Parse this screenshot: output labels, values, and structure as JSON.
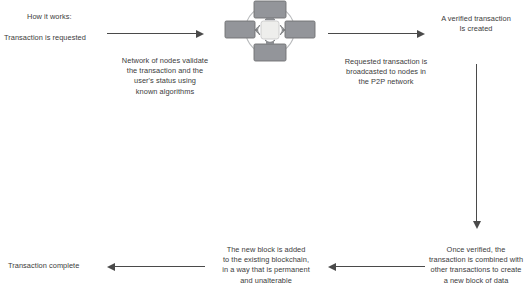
{
  "diagram": {
    "title": "How it works:",
    "theme": {
      "text_color": "#3b3b3b",
      "arrow_color": "#4a4a4a",
      "node_fill": "#8f9194",
      "node_stroke": "#6f7173",
      "center_fill": "#e8e8e6",
      "ring_stroke": "#b9bbbd",
      "background": "#ffffff"
    },
    "steps": [
      {
        "id": "transaction-requested",
        "label": "Transaction is requested",
        "align": "left"
      },
      {
        "id": "nodes-validate",
        "label": "Network of nodes validate\nthe transaction and the\nuser's status using\nknown algorithms",
        "align": "center"
      },
      {
        "id": "broadcast-p2p",
        "label": "Requested transaction is\nbroadcasted to nodes in\nthe P2P network",
        "align": "center"
      },
      {
        "id": "verified-transaction",
        "label": "A verified transaction\nIs created",
        "align": "center"
      },
      {
        "id": "new-block-of-data",
        "label": "Once verified, the\ntransaction is combined with\nother transactions to create\na new block of data",
        "align": "center"
      },
      {
        "id": "block-added",
        "label": "The new block is added\nto the existing blockchain,\nin a way that is permanent\nand unalterable",
        "align": "center"
      },
      {
        "id": "transaction-complete",
        "label": "Transaction complete",
        "align": "left"
      }
    ],
    "arrows": [
      {
        "id": "arrow-request-to-network",
        "direction": "right"
      },
      {
        "id": "arrow-network-to-verified",
        "direction": "right"
      },
      {
        "id": "arrow-verified-to-block",
        "direction": "down"
      },
      {
        "id": "arrow-block-to-chain",
        "direction": "left"
      },
      {
        "id": "arrow-chain-to-complete",
        "direction": "left"
      }
    ],
    "graphic": {
      "id": "p2p-network-illustration",
      "node_count": 4,
      "nodes": [
        "node-top",
        "node-right",
        "node-bottom",
        "node-left"
      ],
      "center": "central-ledger-block",
      "signals": [
        "signal-up",
        "signal-right",
        "signal-down",
        "signal-left"
      ]
    }
  }
}
